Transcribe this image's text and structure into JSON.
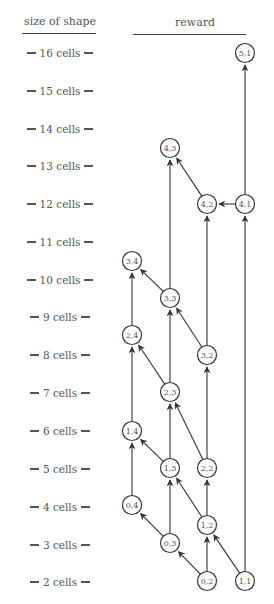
{
  "headers": {
    "left": "size of shape",
    "right": "reward"
  },
  "rows": [
    {
      "label": "16 cells",
      "y": 53
    },
    {
      "label": "15 cells",
      "y": 91
    },
    {
      "label": "14 cells",
      "y": 129
    },
    {
      "label": "13 cells",
      "y": 166
    },
    {
      "label": "12 cells",
      "y": 204
    },
    {
      "label": "11 cells",
      "y": 242
    },
    {
      "label": "10 cells",
      "y": 280
    },
    {
      "label": "9 cells",
      "y": 317
    },
    {
      "label": "8 cells",
      "y": 355
    },
    {
      "label": "7 cells",
      "y": 393
    },
    {
      "label": "6 cells",
      "y": 431
    },
    {
      "label": "5 cells",
      "y": 469
    },
    {
      "label": "4 cells",
      "y": 507
    },
    {
      "label": "3 cells",
      "y": 545
    },
    {
      "label": "2 cells",
      "y": 582
    }
  ],
  "nodes": [
    {
      "id": "5,1",
      "label": "5,1",
      "x": 245,
      "y": 53
    },
    {
      "id": "4,3",
      "label": "4,3",
      "x": 170,
      "y": 148
    },
    {
      "id": "4,2",
      "label": "4,2",
      "x": 207,
      "y": 204
    },
    {
      "id": "4,1",
      "label": "4,1",
      "x": 245,
      "y": 204
    },
    {
      "id": "3,4",
      "label": "3,4",
      "x": 132,
      "y": 261
    },
    {
      "id": "3,3",
      "label": "3,3",
      "x": 170,
      "y": 298
    },
    {
      "id": "2,4",
      "label": "2,4",
      "x": 132,
      "y": 335
    },
    {
      "id": "3,2",
      "label": "3,2",
      "x": 207,
      "y": 355
    },
    {
      "id": "2,3",
      "label": "2,3",
      "x": 170,
      "y": 392
    },
    {
      "id": "1,4",
      "label": "1,4",
      "x": 132,
      "y": 431
    },
    {
      "id": "1,3",
      "label": "1,3",
      "x": 170,
      "y": 468
    },
    {
      "id": "2,2",
      "label": "2,2",
      "x": 207,
      "y": 468
    },
    {
      "id": "0,4",
      "label": "0,4",
      "x": 132,
      "y": 505
    },
    {
      "id": "1,2",
      "label": "1,2",
      "x": 207,
      "y": 525
    },
    {
      "id": "0,3",
      "label": "0,3",
      "x": 170,
      "y": 543
    },
    {
      "id": "0,2",
      "label": "0,2",
      "x": 207,
      "y": 581
    },
    {
      "id": "1,1",
      "label": "1,1",
      "x": 245,
      "y": 581
    }
  ],
  "edges": [
    {
      "from": "0,2",
      "to": "0,3"
    },
    {
      "from": "0,2",
      "to": "1,2"
    },
    {
      "from": "1,1",
      "to": "1,2"
    },
    {
      "from": "1,1",
      "to": "4,1"
    },
    {
      "from": "0,3",
      "to": "0,4"
    },
    {
      "from": "0,3",
      "to": "1,3"
    },
    {
      "from": "1,2",
      "to": "1,3"
    },
    {
      "from": "1,2",
      "to": "2,2"
    },
    {
      "from": "0,4",
      "to": "1,4"
    },
    {
      "from": "1,3",
      "to": "1,4"
    },
    {
      "from": "1,3",
      "to": "2,3"
    },
    {
      "from": "2,2",
      "to": "2,3"
    },
    {
      "from": "2,2",
      "to": "3,2"
    },
    {
      "from": "1,4",
      "to": "2,4"
    },
    {
      "from": "2,3",
      "to": "2,4"
    },
    {
      "from": "2,3",
      "to": "3,3"
    },
    {
      "from": "3,2",
      "to": "3,3"
    },
    {
      "from": "3,2",
      "to": "4,2"
    },
    {
      "from": "2,4",
      "to": "3,4"
    },
    {
      "from": "3,3",
      "to": "3,4"
    },
    {
      "from": "3,3",
      "to": "4,3"
    },
    {
      "from": "4,2",
      "to": "4,3"
    },
    {
      "from": "4,1",
      "to": "4,2"
    },
    {
      "from": "4,1",
      "to": "5,1"
    }
  ],
  "style": {
    "line_color": "#333333",
    "text_color": "#555555",
    "node_radius": 9.5
  }
}
